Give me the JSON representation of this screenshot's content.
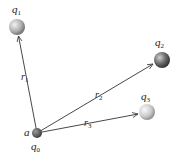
{
  "diagram": {
    "charges": [
      {
        "id": "q0",
        "label": "q",
        "sub": "0",
        "point_label": "a",
        "cx": 37,
        "cy": 133,
        "r": 5,
        "color": "#555555"
      },
      {
        "id": "q1",
        "label": "q",
        "sub": "1",
        "cx": 17,
        "cy": 27,
        "r": 8,
        "color": "#9a9a9a"
      },
      {
        "id": "q2",
        "label": "q",
        "sub": "2",
        "cx": 162,
        "cy": 60,
        "r": 8,
        "color": "#6f6f6f"
      },
      {
        "id": "q3",
        "label": "q",
        "sub": "3",
        "cx": 147,
        "cy": 112,
        "r": 8,
        "color": "#bdbdbd"
      }
    ],
    "vectors": [
      {
        "id": "r1",
        "label": "r",
        "sub": "1",
        "from": "q0",
        "to": "q1"
      },
      {
        "id": "r2",
        "label": "r",
        "sub": "2",
        "from": "q0",
        "to": "q2"
      },
      {
        "id": "r3",
        "label": "r",
        "sub": "3",
        "from": "q0",
        "to": "q3"
      }
    ],
    "text": {
      "q1_label": "q",
      "q1_sub": "1",
      "q2_label": "q",
      "q2_sub": "2",
      "q3_label": "q",
      "q3_sub": "3",
      "q0_label": "q",
      "q0_sub": "0",
      "point_a": "a",
      "r1_label": "r",
      "r1_sub": "1",
      "r2_label": "r",
      "r2_sub": "2",
      "r3_label": "r",
      "r3_sub": "3"
    }
  }
}
